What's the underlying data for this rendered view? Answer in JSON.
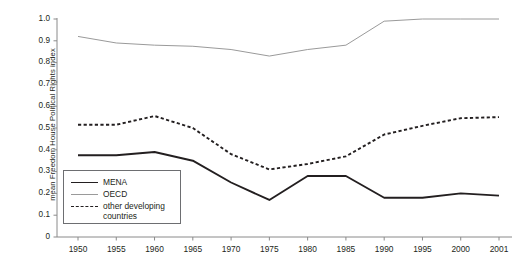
{
  "chart_data": {
    "type": "line",
    "title": "",
    "xlabel": "",
    "ylabel": "mean Freedom House Political Rights index",
    "xlim": [
      1950,
      2001
    ],
    "ylim": [
      0,
      1.0
    ],
    "grid": false,
    "legend_position": "lower-left-inside",
    "x": [
      1950,
      1955,
      1960,
      1965,
      1970,
      1975,
      1980,
      1985,
      1990,
      1995,
      2000,
      2001
    ],
    "x_tick_labels": [
      "1950",
      "1955",
      "1960",
      "1965",
      "1970",
      "1975",
      "1980",
      "1985",
      "1990",
      "1995",
      "2000",
      "2001"
    ],
    "y_tick_labels": [
      "1.0",
      "0.9",
      "0.8",
      "0.7",
      "0.6",
      "0.5",
      "0.4",
      "0.3",
      "0.2",
      "0.1",
      "0"
    ],
    "y_ticks": [
      1.0,
      0.9,
      0.8,
      0.7,
      0.6,
      0.5,
      0.4,
      0.3,
      0.2,
      0.1,
      0
    ],
    "series": [
      {
        "name": "MENA",
        "style": "solid-thick",
        "color": "#231f20",
        "values": [
          0.375,
          0.375,
          0.39,
          0.35,
          0.25,
          0.17,
          0.28,
          0.28,
          0.18,
          0.18,
          0.2,
          0.19
        ]
      },
      {
        "name": "OECD",
        "style": "solid-thin",
        "color": "#9a9a9a",
        "values": [
          0.92,
          0.89,
          0.88,
          0.875,
          0.86,
          0.83,
          0.86,
          0.88,
          0.99,
          1.0,
          1.0,
          1.0
        ]
      },
      {
        "name": "other developing countries",
        "style": "dashed",
        "color": "#231f20",
        "values": [
          0.515,
          0.515,
          0.555,
          0.5,
          0.38,
          0.31,
          0.335,
          0.37,
          0.47,
          0.51,
          0.545,
          0.55
        ]
      }
    ]
  },
  "axes": {
    "y_title": "mean Freedom House Political Rights index"
  },
  "legend": {
    "items": [
      {
        "label": "MENA",
        "label2": ""
      },
      {
        "label": "OECD",
        "label2": ""
      },
      {
        "label": "other developing",
        "label2": "countries"
      }
    ]
  },
  "caption": {
    "text": ""
  }
}
